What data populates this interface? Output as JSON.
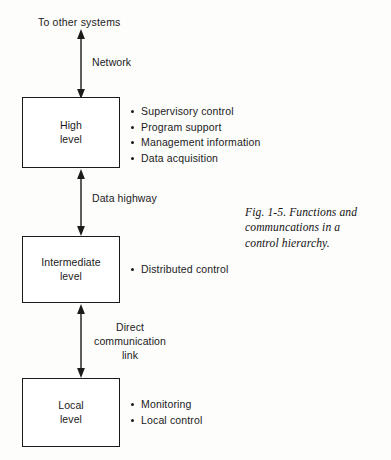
{
  "figure": {
    "top_note": "To other systems",
    "caption": "Fig. 1-5. Functions and\ncommuncations in a\ncontrol hierarchy.",
    "colors": {
      "ink": "#1b1b1b",
      "box_border": "#1a1a1a",
      "background": "#fdfdfc"
    },
    "levels": [
      {
        "name": "high-level",
        "label": "High\nlevel",
        "bullets": [
          "Supervisory control",
          "Program support",
          "Management information",
          "Data acquisition"
        ]
      },
      {
        "name": "intermediate-level",
        "label": "Intermediate\nlevel",
        "bullets": [
          "Distributed control"
        ]
      },
      {
        "name": "local-level",
        "label": "Local\nlevel",
        "bullets": [
          "Monitoring",
          "Local control"
        ]
      }
    ],
    "connectors": [
      {
        "name": "network-link",
        "label": "Network",
        "from": "to-other-systems",
        "to": "high-level",
        "arrowheads": "both"
      },
      {
        "name": "data-highway-link",
        "label": "Data highway",
        "from": "high-level",
        "to": "intermediate-level",
        "arrowheads": "both"
      },
      {
        "name": "direct-communication-link",
        "label": "Direct\ncommunication\nlink",
        "from": "intermediate-level",
        "to": "local-level",
        "arrowheads": "both"
      }
    ]
  }
}
